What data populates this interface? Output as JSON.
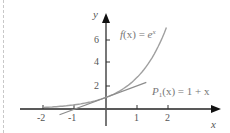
{
  "chart_data": {
    "type": "line",
    "title": "",
    "xlabel": "x",
    "ylabel": "y",
    "xlim": [
      -2.5,
      3.6
    ],
    "ylim": [
      -0.5,
      8
    ],
    "x_ticks": [
      -2,
      -1,
      1,
      2
    ],
    "x_tick_labels": [
      "-2",
      "-1",
      "1",
      "2"
    ],
    "y_ticks": [
      2,
      4,
      6
    ],
    "y_tick_labels": [
      "2",
      "4",
      "6"
    ],
    "grid": false,
    "series": [
      {
        "name": "f(x) = e^x",
        "label_parts": {
          "f": "f",
          "arg": "(x) = ",
          "base": "e",
          "exp": "x"
        },
        "x": [
          -2.0,
          -1.5,
          -1.0,
          -0.5,
          0.0,
          0.5,
          1.0,
          1.5,
          1.95
        ],
        "values": [
          0.135,
          0.223,
          0.368,
          0.607,
          1.0,
          1.649,
          2.718,
          4.482,
          7.03
        ],
        "color": "#9a9a9a"
      },
      {
        "name": "P1(x) = 1 + x",
        "label_parts": {
          "p": "P",
          "sub": "1",
          "rest": "(x) = 1 + x"
        },
        "x": [
          -1.5,
          1.3
        ],
        "values": [
          -0.5,
          2.3
        ],
        "color": "#8a8a8a"
      }
    ],
    "annotations": [
      "f(x) = e^x",
      "P1(x) = 1 + x"
    ]
  }
}
